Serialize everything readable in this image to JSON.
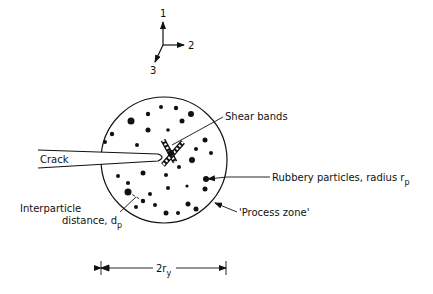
{
  "figure": {
    "background": "#ffffff",
    "ink": "#111111",
    "axes": {
      "labels": [
        "1",
        "2",
        "3"
      ]
    },
    "labels": {
      "crack": "Crack",
      "shear_bands": "Shear bands",
      "rubbery_particles": "Rubbery particles, radius r",
      "rubbery_particles_sub": "p",
      "process_zone": "'Process zone'",
      "interparticle_line1": "Interparticle",
      "interparticle_line2": "distance, d",
      "interparticle_sub": "p",
      "dimension": "2r",
      "dimension_sub": "y"
    },
    "process_zone": {
      "cx": 164,
      "cy": 160,
      "r": 63
    },
    "particles": [
      [
        131,
        121,
        3.5
      ],
      [
        148,
        114,
        2.2
      ],
      [
        161,
        107,
        2
      ],
      [
        112,
        134,
        2.2
      ],
      [
        148,
        130,
        2.5
      ],
      [
        137,
        145,
        2
      ],
      [
        105,
        142,
        2
      ],
      [
        176,
        108,
        2.2
      ],
      [
        191,
        114,
        3
      ],
      [
        168,
        130,
        1.8
      ],
      [
        182,
        121,
        2.5
      ],
      [
        205,
        140,
        2.5
      ],
      [
        196,
        149,
        2
      ],
      [
        211,
        153,
        2
      ],
      [
        192,
        160,
        3
      ],
      [
        179,
        167,
        2
      ],
      [
        206,
        179,
        3
      ],
      [
        205,
        189,
        2.5
      ],
      [
        187,
        186,
        1.6
      ],
      [
        188,
        204,
        2.5
      ],
      [
        168,
        188,
        2
      ],
      [
        166,
        213,
        2.5
      ],
      [
        178,
        213,
        2
      ],
      [
        155,
        205,
        2
      ],
      [
        143,
        173,
        2.5
      ],
      [
        128,
        183,
        2
      ],
      [
        118,
        176,
        2
      ],
      [
        150,
        194,
        2
      ],
      [
        136,
        207,
        2
      ],
      [
        166,
        175,
        2
      ],
      [
        128,
        192,
        3.5
      ],
      [
        143,
        201,
        2.2
      ],
      [
        196,
        209,
        2.5
      ]
    ]
  }
}
